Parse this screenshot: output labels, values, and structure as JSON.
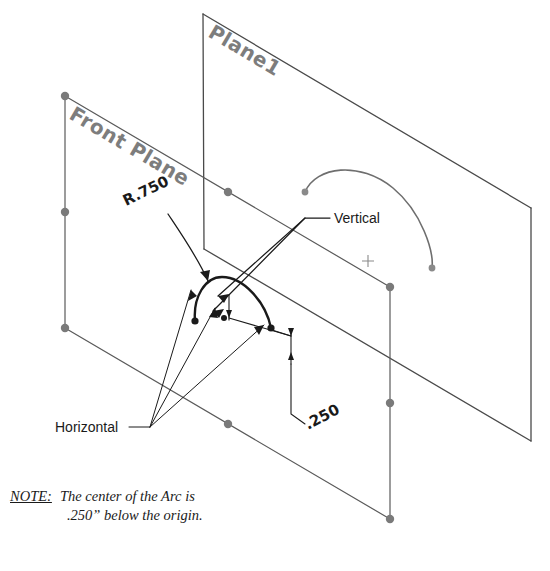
{
  "drawing": {
    "title_planes": {
      "plane1_label": "Plane1",
      "front_plane_label": "Front Plane"
    },
    "annotations": {
      "radius_dim": "R.750",
      "vertical_label": "Vertical",
      "horizontal_label": "Horizontal",
      "offset_dim": ".250"
    },
    "note": {
      "prefix": "NOTE:",
      "line1": "The center of the Arc is",
      "line2": ".250” below the origin."
    },
    "colors": {
      "plane_edge": "#5a5a5a",
      "handle_dot": "#7a7a7a",
      "sketch_arc": "#1a1a1a",
      "gray_arc": "#6e6e6e",
      "text": "#1a1a1a",
      "plane_text": "#7d7d7d",
      "background": "#ffffff"
    }
  }
}
